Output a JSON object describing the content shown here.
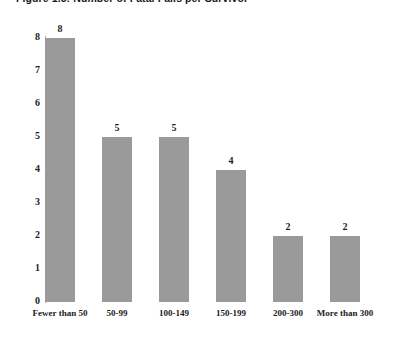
{
  "figure": {
    "title": "Figure 1.5:  Number of Fatal Falls per Survivor"
  },
  "chart_data": {
    "type": "bar",
    "title": "Figure 1.5:  Number of Fatal Falls per Survivor",
    "xlabel": "",
    "ylabel": "",
    "categories": [
      "Fewer than 50",
      "50-99",
      "100-149",
      "150-199",
      "200-300",
      "More than 300"
    ],
    "values": [
      8,
      5,
      5,
      4,
      2,
      2
    ],
    "data_labels": [
      "8",
      "5",
      "5",
      "4",
      "2",
      "2"
    ],
    "ylim": [
      0,
      8
    ],
    "y_ticks": [
      "0",
      "1",
      "2",
      "3",
      "4",
      "5",
      "6",
      "7",
      "8"
    ],
    "grid": false,
    "legend": null,
    "bar_color": "#9a9a9a",
    "background_color": "#ffffff",
    "axis_color": "#a8a8a8"
  }
}
